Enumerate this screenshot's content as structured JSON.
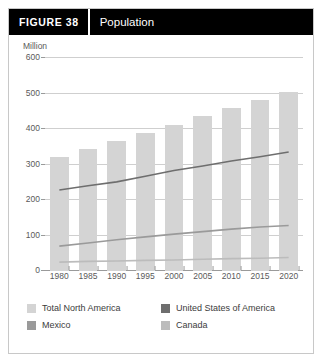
{
  "header": {
    "figure_number": "FIGURE 38",
    "title": "Population"
  },
  "chart_data": {
    "type": "bar",
    "title": "Population",
    "xlabel": "",
    "ylabel": "Million",
    "ylim": [
      0,
      600
    ],
    "yticks": [
      0,
      100,
      200,
      300,
      400,
      500,
      600
    ],
    "grid": true,
    "legend_position": "bottom",
    "categories": [
      "1980",
      "1985",
      "1990",
      "1995",
      "2000",
      "2005",
      "2010",
      "2015",
      "2020"
    ],
    "series": [
      {
        "name": "Total North America",
        "render": "bar",
        "color": "#d4d4d4",
        "values": [
          320,
          345,
          366,
          390,
          412,
          436,
          460,
          482,
          503
        ]
      },
      {
        "name": "United States of America",
        "render": "line",
        "color": "#6e6e6e",
        "values": [
          228,
          240,
          251,
          267,
          283,
          296,
          310,
          322,
          335
        ]
      },
      {
        "name": "Mexico",
        "render": "line",
        "color": "#9a9a9a",
        "values": [
          70,
          79,
          88,
          96,
          104,
          111,
          118,
          124,
          128
        ]
      },
      {
        "name": "Canada",
        "render": "line",
        "color": "#bcbcbc",
        "values": [
          25,
          27,
          28,
          30,
          31,
          33,
          35,
          36,
          38
        ]
      }
    ]
  },
  "legend": {
    "items": [
      {
        "label": "Total North America",
        "color": "#d4d4d4"
      },
      {
        "label": "United States of America",
        "color": "#6e6e6e"
      },
      {
        "label": "Mexico",
        "color": "#9a9a9a"
      },
      {
        "label": "Canada",
        "color": "#bcbcbc"
      }
    ]
  }
}
